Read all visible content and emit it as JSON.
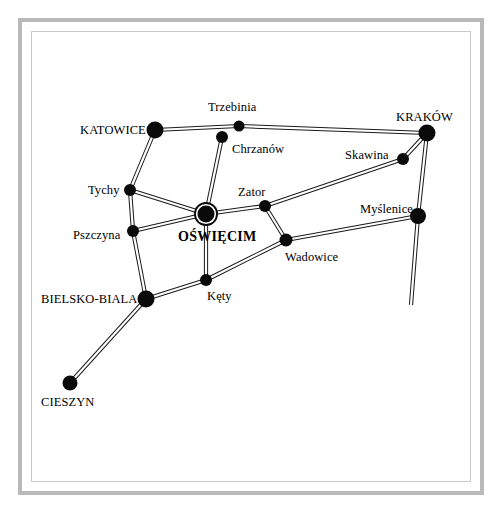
{
  "map": {
    "title": "Oświęcim region road network map",
    "background_color": "#ffffff",
    "frame_color": "#b9b9b9",
    "road_color": "#1a1a1a",
    "node_color": "#0a0a0a",
    "hub_city": "OŚWIĘCIM",
    "nodes": [
      {
        "id": "katowice",
        "label": "KATOWICE",
        "x": 155,
        "y": 130,
        "r": 8.5,
        "kind": "major",
        "label_x": 80,
        "label_y": 124,
        "label_anchor": "left"
      },
      {
        "id": "trzebinia",
        "label": "Trzebinia",
        "x": 239,
        "y": 126,
        "r": 5.5,
        "kind": "minor",
        "label_x": 208,
        "label_y": 101,
        "label_anchor": "left"
      },
      {
        "id": "chrzanow",
        "label": "Chrzanów",
        "x": 222,
        "y": 137,
        "r": 6.0,
        "kind": "minor",
        "label_x": 232,
        "label_y": 143,
        "label_anchor": "left"
      },
      {
        "id": "krakow",
        "label": "KRAKÓW",
        "x": 427,
        "y": 133,
        "r": 8.5,
        "kind": "major",
        "label_x": 396,
        "label_y": 111,
        "label_anchor": "left"
      },
      {
        "id": "skawina",
        "label": "Skawina",
        "x": 403,
        "y": 159,
        "r": 6.0,
        "kind": "minor",
        "label_x": 345,
        "label_y": 149,
        "label_anchor": "left"
      },
      {
        "id": "tychy",
        "label": "Tychy",
        "x": 130,
        "y": 190,
        "r": 6.0,
        "kind": "minor",
        "label_x": 88,
        "label_y": 184,
        "label_anchor": "left"
      },
      {
        "id": "zator",
        "label": "Zator",
        "x": 265,
        "y": 206,
        "r": 6.0,
        "kind": "minor",
        "label_x": 238,
        "label_y": 186,
        "label_anchor": "left"
      },
      {
        "id": "myslenice",
        "label": "Myślenice",
        "x": 418,
        "y": 216,
        "r": 8.0,
        "kind": "minor",
        "label_x": 360,
        "label_y": 203,
        "label_anchor": "left"
      },
      {
        "id": "oswiecim",
        "label": "OŚWIĘCIM",
        "x": 206,
        "y": 214,
        "r": 8.5,
        "kind": "hub",
        "label_x": 178,
        "label_y": 230,
        "label_anchor": "left"
      },
      {
        "id": "pszczyna",
        "label": "Pszczyna",
        "x": 133,
        "y": 231,
        "r": 6.0,
        "kind": "minor",
        "label_x": 73,
        "label_y": 229,
        "label_anchor": "left"
      },
      {
        "id": "wadowice",
        "label": "Wadowice",
        "x": 286,
        "y": 240,
        "r": 6.5,
        "kind": "minor",
        "label_x": 285,
        "label_y": 251,
        "label_anchor": "left"
      },
      {
        "id": "kety",
        "label": "Kęty",
        "x": 206,
        "y": 280,
        "r": 6.0,
        "kind": "minor",
        "label_x": 207,
        "label_y": 290,
        "label_anchor": "left"
      },
      {
        "id": "bielsko",
        "label": "BIELSKO-BIALA",
        "x": 146,
        "y": 299,
        "r": 8.5,
        "kind": "major",
        "label_x": 41,
        "label_y": 293,
        "label_anchor": "left"
      },
      {
        "id": "cieszyn",
        "label": "CIESZYN",
        "x": 70,
        "y": 383,
        "r": 7.5,
        "kind": "major",
        "label_x": 41,
        "label_y": 396,
        "label_anchor": "left"
      }
    ],
    "roads": [
      {
        "id": "katowice-trzebinia-krakow",
        "from": "katowice",
        "to": "krakow",
        "path": "M 155 130 L 239 126 L 427 133"
      },
      {
        "id": "katowice-tychy",
        "from": "katowice",
        "to": "tychy",
        "path": "M 155 130 L 130 190"
      },
      {
        "id": "chrzanow-oswiecim",
        "from": "chrzanow",
        "to": "oswiecim",
        "path": "M 222 137 L 206 214"
      },
      {
        "id": "tychy-oswiecim",
        "from": "tychy",
        "to": "oswiecim",
        "path": "M 130 190 L 206 214"
      },
      {
        "id": "tychy-pszczyna",
        "from": "tychy",
        "to": "pszczyna",
        "path": "M 130 190 L 133 231"
      },
      {
        "id": "pszczyna-oswiecim-zator",
        "from": "pszczyna",
        "to": "zator",
        "path": "M 133 231 L 206 214 L 265 206"
      },
      {
        "id": "tychy-pszczyna-bielsko",
        "from": "pszczyna",
        "to": "bielsko",
        "path": "M 133 231 L 146 299"
      },
      {
        "id": "oswiecim-kety",
        "from": "oswiecim",
        "to": "kety",
        "path": "M 206 214 L 206 280"
      },
      {
        "id": "bielsko-kety-wadowice",
        "from": "bielsko",
        "to": "wadowice",
        "path": "M 146 299 L 206 280 L 286 240"
      },
      {
        "id": "zator-wadowice",
        "from": "zator",
        "to": "wadowice",
        "path": "M 265 206 L 286 240"
      },
      {
        "id": "zator-skawina-krakow",
        "from": "zator",
        "to": "krakow",
        "path": "M 265 206 L 403 159 L 427 133"
      },
      {
        "id": "wadowice-myslenice",
        "from": "wadowice",
        "to": "myslenice",
        "path": "M 286 240 L 418 216"
      },
      {
        "id": "krakow-myslenice-south",
        "from": "krakow",
        "to": "south-edge",
        "path": "M 427 133 L 418 216 L 411 305"
      },
      {
        "id": "bielsko-cieszyn",
        "from": "bielsko",
        "to": "cieszyn",
        "path": "M 146 299 L 70 383"
      }
    ]
  }
}
